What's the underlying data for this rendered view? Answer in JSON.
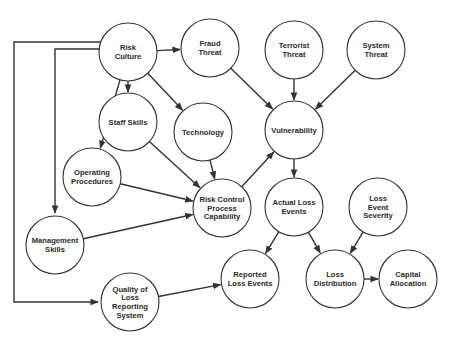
{
  "diagram": {
    "type": "directed-graph",
    "colors": {
      "stroke": "#333333",
      "fill": "#ffffff",
      "text": "#2a2a2a"
    },
    "nodes": [
      {
        "id": "risk_culture",
        "label": "Risk Culture",
        "lines": [
          "Risk",
          "Culture"
        ],
        "x": 128,
        "y": 52
      },
      {
        "id": "fraud_threat",
        "label": "Fraud Threat",
        "lines": [
          "Fraud",
          "Threat"
        ],
        "x": 210,
        "y": 48
      },
      {
        "id": "terrorist_threat",
        "label": "Terrorist Threat",
        "lines": [
          "Terrorist",
          "Threat"
        ],
        "x": 294,
        "y": 50
      },
      {
        "id": "system_threat",
        "label": "System Threat",
        "lines": [
          "System",
          "Threat"
        ],
        "x": 376,
        "y": 50
      },
      {
        "id": "staff_skills",
        "label": "Staff Skills",
        "lines": [
          "Staff Skills"
        ],
        "x": 128,
        "y": 122
      },
      {
        "id": "technology",
        "label": "Technology",
        "lines": [
          "Technology"
        ],
        "x": 203,
        "y": 132
      },
      {
        "id": "vulnerability",
        "label": "Vulnerability",
        "lines": [
          "Vulnerability"
        ],
        "x": 294,
        "y": 130
      },
      {
        "id": "operating_procedures",
        "label": "Operating Procedures",
        "lines": [
          "Operating",
          "Procedures"
        ],
        "x": 92,
        "y": 177
      },
      {
        "id": "risk_control",
        "label": "Risk Control Process Capability",
        "lines": [
          "Risk Control",
          "Process",
          "Capability"
        ],
        "x": 222,
        "y": 208
      },
      {
        "id": "actual_loss_events",
        "label": "Actual Loss Events",
        "lines": [
          "Actual Loss",
          "Events"
        ],
        "x": 294,
        "y": 207
      },
      {
        "id": "loss_event_severity",
        "label": "Loss Event Severity",
        "lines": [
          "Loss",
          "Event",
          "Severity"
        ],
        "x": 378,
        "y": 207
      },
      {
        "id": "management_skills",
        "label": "Management Skills",
        "lines": [
          "Management",
          "Skills"
        ],
        "x": 55,
        "y": 245
      },
      {
        "id": "quality_loss_reporting",
        "label": "Quality of Loss Reporting System",
        "lines": [
          "Quality of",
          "Loss",
          "Reporting",
          "System"
        ],
        "x": 130,
        "y": 302
      },
      {
        "id": "reported_loss_events",
        "label": "Reported Loss Events",
        "lines": [
          "Reported",
          "Loss Events"
        ],
        "x": 250,
        "y": 279
      },
      {
        "id": "loss_distribution",
        "label": "Loss Distribution",
        "lines": [
          "Loss",
          "Distribution"
        ],
        "x": 335,
        "y": 279
      },
      {
        "id": "capital_allocation",
        "label": "Capital Allocation",
        "lines": [
          "Capital",
          "Allocation"
        ],
        "x": 408,
        "y": 279
      }
    ],
    "edges": [
      {
        "from": "risk_culture",
        "to": "fraud_threat"
      },
      {
        "from": "risk_culture",
        "to": "staff_skills"
      },
      {
        "from": "risk_culture",
        "to": "technology"
      },
      {
        "from": "risk_culture",
        "to": "operating_procedures"
      },
      {
        "from": "risk_culture",
        "to": "management_skills"
      },
      {
        "from": "risk_culture",
        "to": "quality_loss_reporting"
      },
      {
        "from": "fraud_threat",
        "to": "vulnerability"
      },
      {
        "from": "terrorist_threat",
        "to": "vulnerability"
      },
      {
        "from": "system_threat",
        "to": "vulnerability"
      },
      {
        "from": "staff_skills",
        "to": "risk_control"
      },
      {
        "from": "technology",
        "to": "risk_control"
      },
      {
        "from": "operating_procedures",
        "to": "risk_control"
      },
      {
        "from": "management_skills",
        "to": "risk_control"
      },
      {
        "from": "risk_control",
        "to": "vulnerability"
      },
      {
        "from": "vulnerability",
        "to": "actual_loss_events"
      },
      {
        "from": "actual_loss_events",
        "to": "reported_loss_events"
      },
      {
        "from": "actual_loss_events",
        "to": "loss_distribution"
      },
      {
        "from": "loss_event_severity",
        "to": "loss_distribution"
      },
      {
        "from": "quality_loss_reporting",
        "to": "reported_loss_events"
      },
      {
        "from": "loss_distribution",
        "to": "capital_allocation"
      }
    ]
  }
}
